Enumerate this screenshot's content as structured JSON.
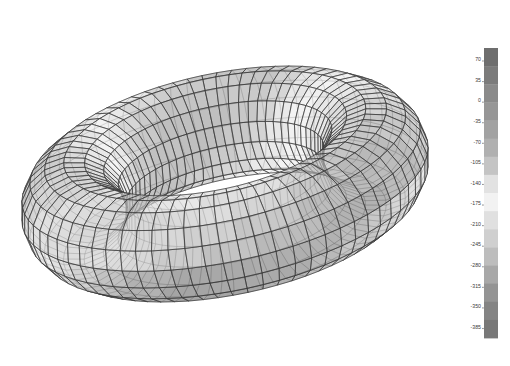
{
  "figure": {
    "type": "fea-contour-plot",
    "background_color": "#ffffff",
    "title": "",
    "subtitle": ""
  },
  "model": {
    "name": "toroidal-shell-mesh",
    "geometry": "torus",
    "render_style": "wireframe-with-shaded-faces",
    "mesh_line_color": "#303030",
    "face_opacity": 0.55,
    "circumferential_divisions": 72,
    "tube_divisions": 16,
    "view": {
      "center_x": 225,
      "center_y": 184,
      "outer_radius_x": 207,
      "outer_radius_y": 162,
      "tube_radius_x": 72,
      "tube_radius_y": 56,
      "tilt_degrees": -12
    }
  },
  "chart_data": {
    "type": "heatmap",
    "title": "",
    "xlabel": "",
    "ylabel": "",
    "colormap": "grayscale-banded",
    "legend_position": "right",
    "grid": false,
    "colorbar": {
      "orientation": "vertical",
      "min": -385,
      "max": 70,
      "step": 35,
      "tick_labels": [
        "70",
        "35",
        "0",
        "-35",
        "-70",
        "-105",
        "-140",
        "-175",
        "-210",
        "-245",
        "-280",
        "-315",
        "-350",
        "-385"
      ],
      "tick_values": [
        70,
        35,
        0,
        -35,
        -70,
        -105,
        -140,
        -175,
        -210,
        -245,
        -280,
        -315,
        -350,
        -385
      ],
      "band_colors": [
        "#6e6e6e",
        "#7b7b7b",
        "#8a8a8a",
        "#969696",
        "#a2a2a2",
        "#b0b0b0",
        "#c4c4c4",
        "#e2e2e2",
        "#f2f2f2",
        "#e0e0e0",
        "#cfcfcf",
        "#bdbdbd",
        "#a8a8a8",
        "#949494",
        "#848484",
        "#787878"
      ],
      "frame_left": 484,
      "frame_top": 48,
      "frame_width": 14,
      "frame_height": 290
    }
  }
}
